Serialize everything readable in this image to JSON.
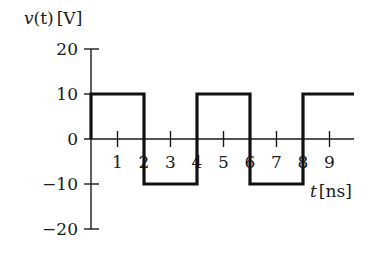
{
  "chart_data": {
    "type": "line",
    "title": "",
    "ylabel": "v(t) [V]",
    "xlabel": "t [ns]",
    "ylim": [
      -20,
      20
    ],
    "xlim": [
      0,
      10
    ],
    "yticks": [
      20,
      10,
      0,
      -10,
      -20
    ],
    "ytick_labels": [
      "20",
      "10",
      "0",
      "−10",
      "−20"
    ],
    "xticks": [
      1,
      2,
      3,
      4,
      5,
      6,
      7,
      8,
      9
    ],
    "xtick_labels": [
      "1",
      "2",
      "3",
      "4",
      "5",
      "6",
      "7",
      "8",
      "9"
    ],
    "grid": false,
    "legend": null,
    "series": [
      {
        "name": "v(t)",
        "style": "square-wave",
        "x": [
          0,
          0,
          2,
          2,
          4,
          4,
          6,
          6,
          8,
          8,
          10
        ],
        "values": [
          0,
          10,
          10,
          -10,
          -10,
          10,
          10,
          -10,
          -10,
          10,
          10
        ]
      }
    ]
  },
  "labels": {
    "y_axis_v": "v",
    "y_axis_t": "(t)",
    "y_axis_unit": "[V]",
    "x_axis_t": "t",
    "x_axis_unit": "[ns]"
  }
}
